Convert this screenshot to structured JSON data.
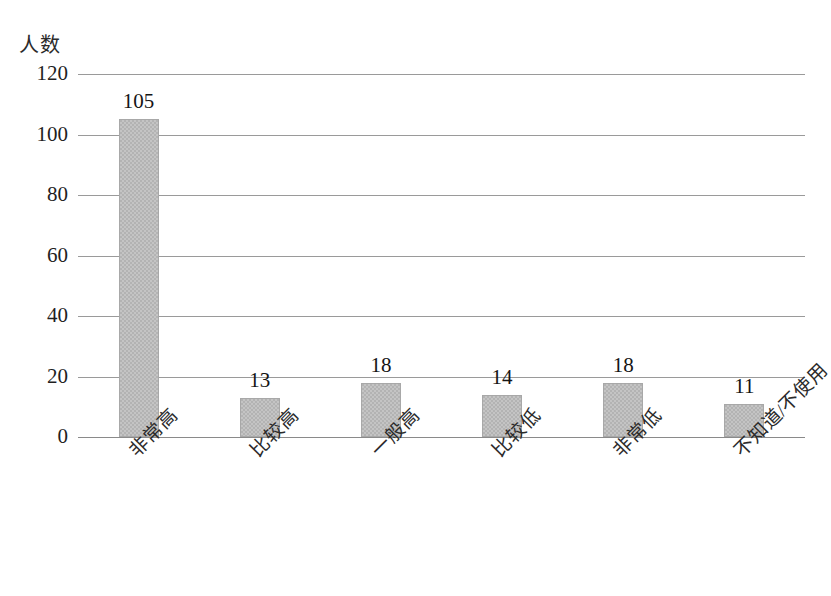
{
  "chart_data": {
    "type": "bar",
    "title": "",
    "subtitle": "",
    "xlabel": "",
    "ylabel": "人数",
    "ylim": [
      0,
      120
    ],
    "yticks": [
      0,
      20,
      40,
      60,
      80,
      100,
      120
    ],
    "ytick_labels": [
      "0",
      "20",
      "40",
      "60",
      "80",
      "100",
      "120"
    ],
    "grid": true,
    "legend": false,
    "legend_position": "none",
    "categories": [
      "非常高",
      "比较高",
      "一般高",
      "比较低",
      "非常低",
      "不知道/不使用"
    ],
    "values": [
      105,
      13,
      18,
      14,
      18,
      11
    ],
    "value_labels": [
      "105",
      "13",
      "18",
      "14",
      "18",
      "11"
    ],
    "bar_color": "#b3b3b3",
    "bar_border_color": "#a8a8a8",
    "gridline_color": "#9a9a9a",
    "axis_color": "#8a8a8a",
    "text_color": "#1f1f1f",
    "category_label_rotation": -45
  }
}
